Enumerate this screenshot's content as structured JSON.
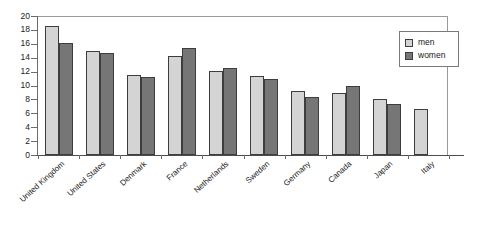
{
  "chart_data": {
    "type": "bar",
    "title": "",
    "subtitle": "",
    "xlabel": "",
    "ylabel": "",
    "ylim": [
      0,
      20
    ],
    "ytick_step": 2,
    "yticks": [
      "20",
      "18",
      "16",
      "14",
      "12",
      "10",
      "8",
      "6",
      "4",
      "2",
      "0"
    ],
    "grid": false,
    "legend_position": "top-right",
    "categories": [
      "United Kingdom",
      "United States",
      "Denmark",
      "France",
      "Netherlands",
      "Sweden",
      "Germany",
      "Canada",
      "Japan",
      "Italy"
    ],
    "series": [
      {
        "name": "men",
        "color": "#d4d4d4",
        "values": [
          18.5,
          14.9,
          11.5,
          14.3,
          12.1,
          11.4,
          9.2,
          8.9,
          8.0,
          6.6
        ]
      },
      {
        "name": "women",
        "color": "#767676",
        "values": [
          16.1,
          14.7,
          11.2,
          15.4,
          12.5,
          10.9,
          8.4,
          10.0,
          7.4,
          null
        ]
      }
    ]
  },
  "legend": {
    "entries": [
      {
        "label": "men"
      },
      {
        "label": "women"
      }
    ]
  },
  "colors": {
    "men_fill": "#d4d4d4",
    "women_fill": "#767676",
    "bar_outline": "#3d3d3d",
    "axis": "#6b6b6b",
    "plot_border": "#9a9a9a",
    "text": "#1a1a1a",
    "background": "#ffffff"
  }
}
